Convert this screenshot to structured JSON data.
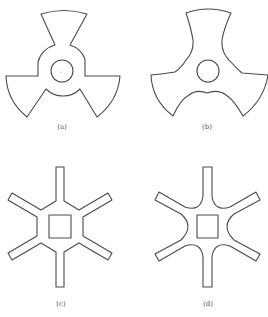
{
  "figure": {
    "panels": [
      {
        "id": "a",
        "label": "(a)",
        "description": "Three-bladed rotor with straight-edged sector blades, central hub ring and circular bore"
      },
      {
        "id": "b",
        "label": "(b)",
        "description": "Three-bladed rotor with smoothly curved (filleted) blade profiles and circular bore"
      },
      {
        "id": "c",
        "label": "(c)",
        "description": "Six-armed star with straight arms and square central hole"
      },
      {
        "id": "d",
        "label": "(d)",
        "description": "Six-armed star with rounded fillets between arms and square central hole"
      }
    ]
  }
}
